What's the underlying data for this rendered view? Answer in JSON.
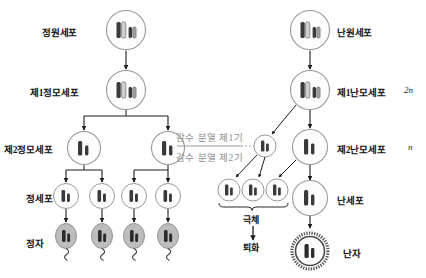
{
  "diagram": {
    "colors": {
      "cell_stroke": "#9a9a9a",
      "chromosome_dark": "#2b2b2b",
      "chromosome_light": "#c9c9c9",
      "arrow": "#1d1d1d",
      "phase_text": "#8e8e8e",
      "sperm_fill": "#b9b9b9",
      "ovum_ring": "#4a4a4a"
    }
  },
  "spermatogenesis": {
    "labels": {
      "spermatogonium": "정원세포",
      "primary_spermatocyte": "제1정모세포",
      "secondary_spermatocyte": "제2정모세포",
      "spermatid": "정세포",
      "sperm": "정자"
    }
  },
  "oogenesis": {
    "labels": {
      "oogonium": "난원세포",
      "primary_oocyte": "제1난모세포",
      "secondary_oocyte": "제2난모세포",
      "ootid": "난세포",
      "ovum": "난자",
      "polar_body": "극체",
      "degeneration": "퇴화"
    },
    "ploidy": {
      "primary_oocyte": "2n",
      "secondary_oocyte": "n"
    }
  },
  "meiosis": {
    "phase1": "감수 분열 제1기",
    "phase2": "감수 분열 제2기"
  }
}
